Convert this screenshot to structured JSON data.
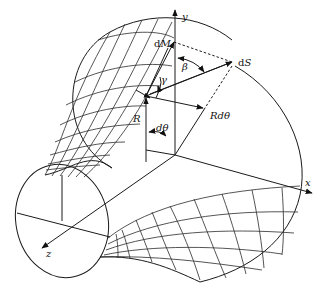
{
  "figure": {
    "type": "3d-surface-geometry",
    "axes": {
      "x_label": "x",
      "y_label": "y",
      "z_label": "z"
    },
    "labels": {
      "dM": "dM",
      "dS": "dS",
      "beta": "β",
      "gamma": "γ",
      "R": "R",
      "Rdtheta": "Rdθ",
      "dtheta": "dθ"
    },
    "colors": {
      "line": "#1a1a1a",
      "background": "#ffffff"
    }
  }
}
